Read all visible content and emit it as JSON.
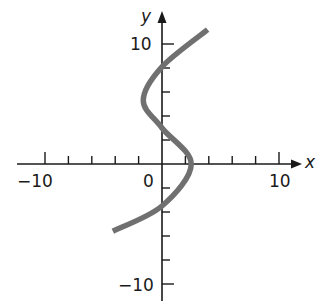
{
  "chart_data": {
    "type": "line",
    "title": "",
    "xlabel": "x",
    "ylabel": "y",
    "xlim": [
      -12,
      12
    ],
    "ylim": [
      -12,
      13
    ],
    "grid": false,
    "legend": null,
    "x_tick_labels": [
      "-10",
      "0",
      "10"
    ],
    "y_tick_labels": [
      "10",
      "-10"
    ],
    "x_ticks": [
      -10,
      -8,
      -6,
      -4,
      -2,
      2,
      4,
      6,
      8,
      10
    ],
    "y_ticks": [
      10,
      8,
      6,
      4,
      2,
      -2,
      -4,
      -6,
      -8,
      -10
    ],
    "series": [
      {
        "name": "curve",
        "description": "x as a cubic function of y (S-shaped curve)",
        "color": "#707070",
        "points": [
          {
            "x": 3.9,
            "y": 11.2
          },
          {
            "x": 0.0,
            "y": 8.1
          },
          {
            "x": -1.6,
            "y": 5.3
          },
          {
            "x": 0.0,
            "y": 3.0
          },
          {
            "x": 2.5,
            "y": 0.0
          },
          {
            "x": 0.0,
            "y": -3.5
          },
          {
            "x": -4.2,
            "y": -5.6
          }
        ]
      }
    ]
  },
  "labels": {
    "x_axis": "x",
    "y_axis": "y",
    "x_neg10": "−10",
    "x_zero": "0",
    "x_pos10": "10",
    "y_pos10": "10",
    "y_neg10": "−10"
  }
}
